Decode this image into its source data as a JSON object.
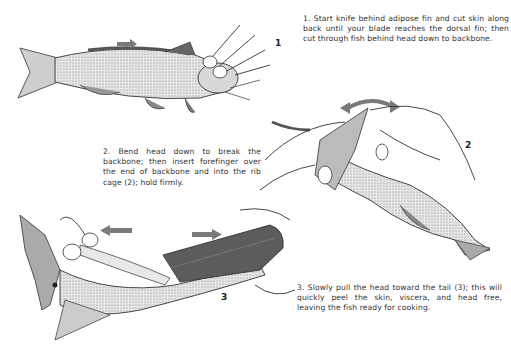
{
  "document": {
    "title": "Skinning a catfish",
    "steps": [
      {
        "number": "1",
        "text": "1. Start knife behind adipose fin and cut skin along back until your blade reaches the dorsal fin; then cut through fish behind head down to backbone.",
        "figure_label": "1"
      },
      {
        "number": "2",
        "text": "2. Bend head down to break the backbone; then insert forefinger over the end of backbone and into the rib cage (2); hold firmly.",
        "figure_label": "2"
      },
      {
        "number": "3",
        "text": "3. Slowly pull the head toward the tail (3); this will quickly peel the skin, viscera, and head free, leaving the fish ready for cooking.",
        "figure_label": "3"
      }
    ],
    "colors": {
      "ink": "#2a2a2a",
      "arrow": "#7a7a7a",
      "skin_shade": "#5c5c5c",
      "body_stipple": "#b8b8b8",
      "background": "#ffffff"
    }
  }
}
